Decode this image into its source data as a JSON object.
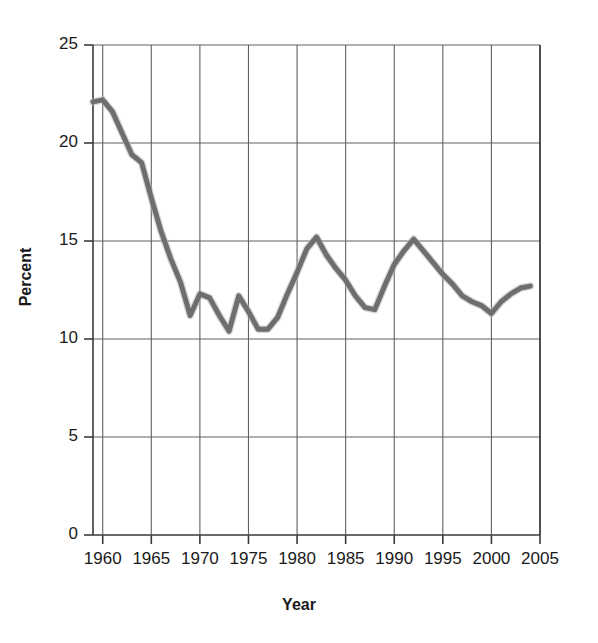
{
  "chart_data": {
    "type": "line",
    "title": "",
    "xlabel": "Year",
    "ylabel": "Percent",
    "xlim": [
      1959,
      2005
    ],
    "ylim": [
      0,
      25
    ],
    "grid": true,
    "legend": false,
    "line_color": "#6e6e6e",
    "xticks": [
      1960,
      1965,
      1970,
      1975,
      1980,
      1985,
      1990,
      1995,
      2000,
      2005
    ],
    "xtick_labels": [
      "1960",
      "1965",
      "1970",
      "1975",
      "1980",
      "1985",
      "1990",
      "1995",
      "2000",
      "2005"
    ],
    "yticks": [
      0,
      5,
      10,
      15,
      20,
      25
    ],
    "ytick_labels": [
      "0",
      "5",
      "10",
      "15",
      "20",
      "25"
    ],
    "x": [
      1959,
      1960,
      1961,
      1962,
      1963,
      1964,
      1965,
      1966,
      1967,
      1968,
      1969,
      1970,
      1971,
      1972,
      1973,
      1974,
      1975,
      1976,
      1977,
      1978,
      1979,
      1980,
      1981,
      1982,
      1983,
      1984,
      1985,
      1986,
      1987,
      1988,
      1989,
      1990,
      1991,
      1992,
      1993,
      1994,
      1995,
      1996,
      1997,
      1998,
      1999,
      2000,
      2001,
      2002,
      2003,
      2004
    ],
    "values": [
      22.1,
      22.2,
      21.6,
      20.5,
      19.4,
      19.0,
      17.2,
      15.5,
      14.1,
      12.9,
      11.2,
      12.3,
      12.1,
      11.2,
      10.4,
      12.2,
      11.4,
      10.5,
      10.5,
      11.1,
      12.3,
      13.4,
      14.6,
      15.2,
      14.3,
      13.6,
      13.0,
      12.2,
      11.6,
      11.5,
      12.7,
      13.8,
      14.5,
      15.1,
      14.5,
      13.9,
      13.3,
      12.8,
      12.2,
      11.9,
      11.7,
      11.3,
      11.9,
      12.3,
      12.6,
      12.7
    ]
  },
  "axes": {
    "y_title": "Percent",
    "x_title": "Year"
  }
}
